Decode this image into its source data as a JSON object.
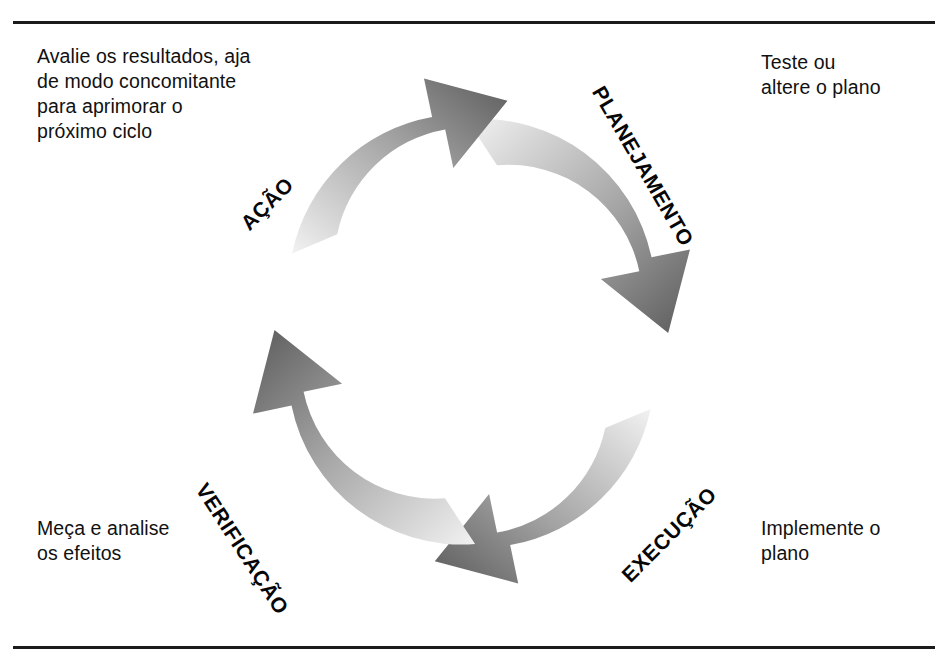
{
  "diagram": {
    "type": "cycle-diagram",
    "direction": "clockwise",
    "colors": {
      "arrow_light": "#eaeaea",
      "arrow_mid": "#a9a9a9",
      "arrow_dark": "#5e5e5e",
      "text": "#111111",
      "rule": "#1b1b1b",
      "background": "#ffffff"
    },
    "rules": {
      "top_label": "top-divider",
      "bottom_label": "bottom-divider"
    },
    "stages": [
      {
        "id": "planejamento",
        "label": "PLANEJAMENTO",
        "quadrant": "top-right",
        "rotation_deg": 60,
        "caption": "Teste ou\naltere o plano",
        "caption_position": "top-right"
      },
      {
        "id": "execucao",
        "label": "EXECUÇÃO",
        "quadrant": "bottom-right",
        "rotation_deg": -45,
        "caption": "Implemente o\nplano",
        "caption_position": "bottom-right"
      },
      {
        "id": "verificacao",
        "label": "VERIFICAÇÃO",
        "quadrant": "bottom-left",
        "rotation_deg": 57,
        "caption": "Meça e analise\nos efeitos",
        "caption_position": "bottom-left"
      },
      {
        "id": "acao",
        "label": "AÇÃO",
        "quadrant": "top-left",
        "rotation_deg": -45,
        "caption": "Avalie os resultados, aja\nde modo concomitante\npara aprimorar o\npróximo ciclo",
        "caption_position": "top-left"
      }
    ]
  }
}
